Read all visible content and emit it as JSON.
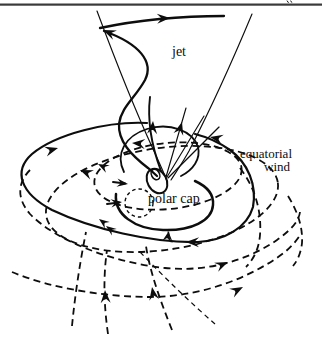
{
  "figure": {
    "background": "#ffffff",
    "ink": "#0d0d0d",
    "rule_color": "#3a3a3a",
    "labels": {
      "jet": "jet",
      "equatorial_line1": "equatorial",
      "equatorial_line2": "wind",
      "polar_cap": "polar cap"
    }
  }
}
